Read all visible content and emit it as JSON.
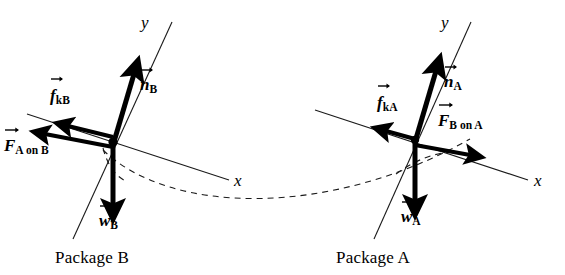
{
  "figure": {
    "background_color": "#ffffff",
    "ink_color": "#000000"
  },
  "packages": [
    {
      "id": "B",
      "caption": "Package B",
      "caption_x": 55,
      "caption_y": 249,
      "origin": {
        "x": 113,
        "y": 145
      },
      "axes": [
        {
          "name": "y-axis",
          "label": "y",
          "label_x": 141,
          "label_y": 14,
          "x1": 172,
          "y1": 22,
          "x2": 73,
          "y2": 239
        },
        {
          "name": "x-axis",
          "label": "x",
          "label_x": 234,
          "label_y": 172,
          "x1": 27,
          "y1": 114,
          "x2": 229,
          "y2": 180
        }
      ],
      "vectors": [
        {
          "name": "normal-force",
          "label_base": "n",
          "label_sub": "B",
          "label_x": 140,
          "label_y": 76,
          "x1": 113,
          "y1": 145,
          "x2": 136,
          "y2": 67,
          "width": 5
        },
        {
          "name": "kinetic-friction-force",
          "label_base": "f",
          "label_sub": "kB",
          "label_x": 50,
          "label_y": 87,
          "x1": 113,
          "y1": 137,
          "x2": 62,
          "y2": 125,
          "width": 4.6
        },
        {
          "name": "tension-force-from-A",
          "label_base": "F",
          "label_sub": "A on B",
          "label_x": 4,
          "label_y": 137,
          "x1": 113,
          "y1": 147,
          "x2": 38,
          "y2": 133,
          "width": 4.6
        },
        {
          "name": "weight-force",
          "label_base": "w",
          "label_sub": "B",
          "label_x": 99,
          "label_y": 212,
          "x1": 113,
          "y1": 145,
          "x2": 113,
          "y2": 212,
          "width": 5
        }
      ],
      "connector_arc": {
        "name": "cord-arc-near-B",
        "path": "M 103 148 Q 110 175 128 182"
      }
    },
    {
      "id": "A",
      "caption": "Package A",
      "caption_x": 336,
      "caption_y": 249,
      "origin": {
        "x": 415,
        "y": 142
      },
      "axes": [
        {
          "name": "y-axis",
          "label": "y",
          "label_x": 441,
          "label_y": 14,
          "x1": 471,
          "y1": 22,
          "x2": 374,
          "y2": 239
        },
        {
          "name": "x-axis",
          "label": "x",
          "label_x": 534,
          "label_y": 172,
          "x1": 315,
          "y1": 110,
          "x2": 528,
          "y2": 180
        }
      ],
      "vectors": [
        {
          "name": "normal-force",
          "label_base": "n",
          "label_sub": "A",
          "label_x": 444,
          "label_y": 73,
          "x1": 415,
          "y1": 142,
          "x2": 437,
          "y2": 64,
          "width": 5
        },
        {
          "name": "kinetic-friction-force",
          "label_base": "f",
          "label_sub": "kA",
          "label_x": 377,
          "label_y": 94,
          "x1": 415,
          "y1": 137,
          "x2": 382,
          "y2": 129,
          "width": 4.6
        },
        {
          "name": "tension-force-from-B",
          "label_base": "F",
          "label_sub": "B on A",
          "label_x": 438,
          "label_y": 112,
          "x1": 415,
          "y1": 146,
          "x2": 476,
          "y2": 156,
          "width": 4.6
        },
        {
          "name": "weight-force",
          "label_base": "w",
          "label_sub": "A",
          "label_x": 401,
          "label_y": 208,
          "x1": 415,
          "y1": 142,
          "x2": 415,
          "y2": 208,
          "width": 5
        }
      ],
      "connector_arc": {
        "name": "cord-arc-near-A",
        "path": "M 398 173 Q 420 157 444 152"
      }
    }
  ],
  "cord": {
    "name": "connecting-cord",
    "path": "M 103 150 C 170 215, 330 218, 470 139"
  }
}
